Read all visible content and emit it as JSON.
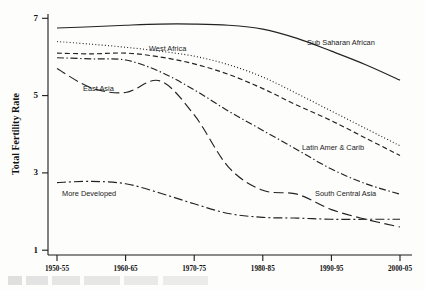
{
  "chart_data": {
    "type": "line",
    "title": "",
    "xlabel": "",
    "ylabel": "Total Fertility Rate",
    "ylim": [
      1,
      7
    ],
    "yticks": [
      1,
      3,
      5,
      7
    ],
    "grid": false,
    "legend_position": "inline-labels",
    "categories": [
      "1950-55",
      "1955-60",
      "1960-65",
      "1965-70",
      "1970-75",
      "1975-80",
      "1980-85",
      "1985-90",
      "1990-95",
      "1995-2000",
      "2000-05"
    ],
    "xticks": [
      "1950-55",
      "1960-65",
      "1970-75",
      "1980-85",
      "1990-95",
      "2000-05"
    ],
    "series": [
      {
        "name": "Sub Saharan African",
        "style": "solid",
        "values": [
          6.75,
          6.78,
          6.82,
          6.85,
          6.85,
          6.82,
          6.72,
          6.48,
          6.15,
          5.8,
          5.4
        ]
      },
      {
        "name": "West Africa",
        "style": "dotted",
        "values": [
          6.4,
          6.33,
          6.25,
          6.15,
          6.02,
          5.8,
          5.48,
          5.05,
          4.6,
          4.15,
          3.7
        ]
      },
      {
        "name": "Middle Africa",
        "style": "dashed-long",
        "values": [
          6.1,
          6.08,
          6.1,
          6.0,
          5.82,
          5.55,
          5.18,
          4.75,
          4.35,
          3.9,
          3.45
        ]
      },
      {
        "name": "Latin Amer & Carib",
        "style": "dash-dot",
        "values": [
          5.98,
          5.95,
          5.92,
          5.62,
          5.15,
          4.6,
          4.1,
          3.6,
          3.1,
          2.72,
          2.45
        ]
      },
      {
        "name": "East Asia",
        "style": "dashed-wide",
        "values": [
          5.7,
          5.2,
          5.08,
          5.38,
          4.5,
          3.15,
          2.55,
          2.45,
          2.05,
          1.8,
          1.6
        ]
      },
      {
        "name": "South Central Asia",
        "style": "dash-dot-short",
        "values": [
          2.75,
          2.78,
          2.72,
          2.48,
          2.2,
          1.95,
          1.85,
          1.83,
          1.8,
          1.8,
          1.8
        ]
      }
    ],
    "annotations": [
      {
        "text": "Sub Saharan African",
        "x": 0.8,
        "y": 6.55
      },
      {
        "text": "West Africa",
        "x": 0.33,
        "y": 6.3
      },
      {
        "text": "East Asia",
        "x": 0.13,
        "y": 5.15
      },
      {
        "text": "Latin Amer & Carib",
        "x": 0.8,
        "y": 3.35
      },
      {
        "text": "South Central Asia",
        "x": 0.83,
        "y": 2.48
      },
      {
        "text": "More Developed",
        "x": 0.17,
        "y": 2.35
      }
    ]
  },
  "axes": {
    "ytick_labels": [
      "7",
      "5",
      "3",
      "1"
    ],
    "xtick_labels": [
      "1950-55",
      "1960-65",
      "1970-75",
      "1980-85",
      "1990-95",
      "2000-05"
    ],
    "ylabel": "Total Fertility Rate"
  },
  "labels": {
    "sub_saharan": "Sub Saharan African",
    "west_africa": "West Africa",
    "east_asia": "East Asia",
    "latin_amer": "Latin Amer & Carib",
    "south_central": "South Central Asia",
    "more_developed": "More Developed"
  }
}
